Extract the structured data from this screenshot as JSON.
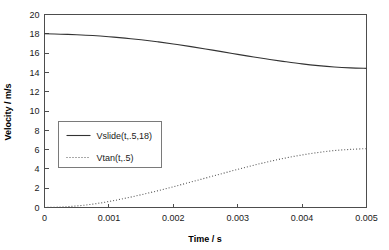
{
  "chart_data": {
    "type": "line",
    "title": "",
    "xlabel": "Time / s",
    "ylabel": "Velocity / m/s",
    "xlim": [
      0,
      0.005
    ],
    "ylim": [
      0,
      20
    ],
    "grid": false,
    "legend_position": "inside-left-middle",
    "x_ticks": [
      0,
      0.001,
      0.002,
      0.003,
      0.004,
      0.005
    ],
    "x_tick_labels": [
      "0",
      "0.001",
      "0.002",
      "0.003",
      "0.004",
      "0.005"
    ],
    "y_ticks": [
      0,
      2,
      4,
      6,
      8,
      10,
      12,
      14,
      16,
      18,
      20
    ],
    "y_tick_labels": [
      "0",
      "2",
      "4",
      "6",
      "8",
      "10",
      "12",
      "14",
      "16",
      "18",
      "20"
    ],
    "x": [
      0,
      0.00025,
      0.0005,
      0.00075,
      0.001,
      0.00125,
      0.0015,
      0.00175,
      0.002,
      0.00225,
      0.0025,
      0.00275,
      0.003,
      0.00325,
      0.0035,
      0.00375,
      0.004,
      0.00425,
      0.0045,
      0.00475,
      0.005
    ],
    "series": [
      {
        "name": "Vslide(t,.5,18)",
        "style": "solid",
        "color": "#333333",
        "values": [
          18.0,
          17.96,
          17.9,
          17.82,
          17.7,
          17.55,
          17.38,
          17.18,
          16.95,
          16.7,
          16.43,
          16.15,
          15.87,
          15.6,
          15.34,
          15.1,
          14.88,
          14.7,
          14.56,
          14.47,
          14.42
        ]
      },
      {
        "name": "Vtan(t,.5)",
        "style": "dotted",
        "color": "#555555",
        "values": [
          0.0,
          0.05,
          0.16,
          0.35,
          0.62,
          0.95,
          1.32,
          1.72,
          2.15,
          2.6,
          3.05,
          3.5,
          3.95,
          4.38,
          4.78,
          5.14,
          5.45,
          5.7,
          5.9,
          6.02,
          6.1
        ]
      }
    ]
  },
  "legend": {
    "entries": [
      {
        "label": "Vslide(t,.5,18)",
        "style": "solid"
      },
      {
        "label": "Vtan(t,.5)",
        "style": "dotted"
      }
    ]
  }
}
